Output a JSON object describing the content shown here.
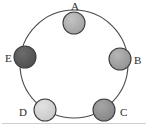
{
  "figure": {
    "name": "circular-node-diagram",
    "background_color": "#ffffff",
    "ring": {
      "name": "circle-path",
      "center_x": 74,
      "center_y": 64,
      "radius": 54,
      "stroke_color": "#4a4a4a",
      "stroke_width": 1.1,
      "fill": "none"
    },
    "node_style": {
      "radius": 11,
      "stroke_color": "#3d3d3d",
      "stroke_width": 1.1
    },
    "nodes": [
      {
        "id": "A",
        "label": "A",
        "cx": 74,
        "cy": 23,
        "fill_color": "#a9a9a9",
        "label_x": 71,
        "label_y": 1,
        "label_position": "above"
      },
      {
        "id": "B",
        "label": "B",
        "cx": 120,
        "cy": 59,
        "fill_color": "#9b9b9b",
        "label_x": 134,
        "label_y": 55,
        "label_position": "right"
      },
      {
        "id": "C",
        "label": "C",
        "cx": 104,
        "cy": 110,
        "fill_color": "#8d8d8d",
        "label_x": 120,
        "label_y": 107,
        "label_position": "right"
      },
      {
        "id": "D",
        "label": "D",
        "cx": 45,
        "cy": 110,
        "fill_color": "#d2d2d2",
        "label_x": 19,
        "label_y": 107,
        "label_position": "left"
      },
      {
        "id": "E",
        "label": "E",
        "cx": 25,
        "cy": 57,
        "fill_color": "#585858",
        "label_x": 5,
        "label_y": 53,
        "label_position": "left"
      }
    ],
    "bottom_rule": {
      "name": "bottom-divider",
      "color": "#cfcfcf",
      "y": 123
    }
  }
}
